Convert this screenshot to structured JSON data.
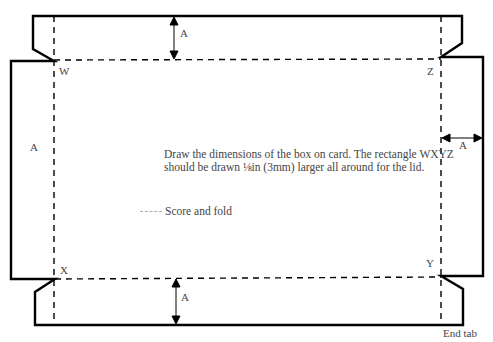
{
  "diagram": {
    "corner_labels": {
      "W": "W",
      "X": "X",
      "Y": "Y",
      "Z": "Z"
    },
    "dimension_labels": {
      "top": "A",
      "bottom": "A",
      "left": "A",
      "right": "A"
    },
    "instruction_text": "Draw the dimensions of the box on card. The rectangle WXYZ should be drawn ⅛in (3mm) larger all around for the lid.",
    "legend": {
      "line_style": "dashed",
      "label": "Score and fold"
    },
    "end_tab_label": "End tab",
    "colors": {
      "cut_line": "#000000",
      "fold_line": "#000000",
      "text": "#444444"
    }
  }
}
